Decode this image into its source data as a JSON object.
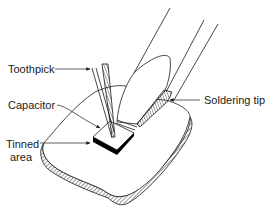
{
  "diagram": {
    "type": "technical-illustration",
    "labels": {
      "toothpick": "Toothpick",
      "capacitor": "Capacitor",
      "tinned_area_line1": "Tinned",
      "tinned_area_line2": "area",
      "soldering_tip": "Soldering tip"
    },
    "colors": {
      "line": "#1a1a1a",
      "background": "#ffffff",
      "fill_dark": "#000000"
    }
  }
}
